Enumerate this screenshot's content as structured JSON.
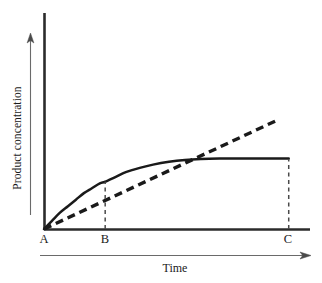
{
  "chart_data": {
    "type": "line",
    "title": "",
    "xlabel": "Time",
    "ylabel": "Product concentration",
    "grid": false,
    "legend": "none",
    "xlim": [
      0,
      100
    ],
    "ylim": [
      0,
      100
    ],
    "xtick_labels": [
      "A",
      "B",
      "C"
    ],
    "xtick_values": [
      0,
      23,
      92
    ],
    "ytick_labels": [],
    "annotations": [
      {
        "name": "dropline-b",
        "label": "B",
        "style": "dashed-vertical",
        "x": 23,
        "y_top": 29
      },
      {
        "name": "dropline-c",
        "label": "C",
        "style": "dashed-vertical",
        "x": 92,
        "y_top": 43
      }
    ],
    "series": [
      {
        "name": "product-formation-curve",
        "style": "solid",
        "color": "#1a1a1a",
        "points": [
          [
            0,
            0
          ],
          [
            3,
            5
          ],
          [
            6,
            10
          ],
          [
            9,
            14
          ],
          [
            12,
            18
          ],
          [
            15,
            22
          ],
          [
            18,
            25
          ],
          [
            21,
            28
          ],
          [
            23,
            29
          ],
          [
            27,
            32
          ],
          [
            31,
            35
          ],
          [
            36,
            37.5
          ],
          [
            41,
            39.5
          ],
          [
            47,
            41.2
          ],
          [
            53,
            42.3
          ],
          [
            59,
            42.9
          ],
          [
            66,
            43.2
          ],
          [
            74,
            43.3
          ],
          [
            83,
            43.3
          ],
          [
            92,
            43.2
          ]
        ]
      },
      {
        "name": "initial-rate-tangent",
        "style": "dashed",
        "color": "#1a1a1a",
        "points": [
          [
            0,
            0
          ],
          [
            88,
            67
          ]
        ]
      }
    ]
  },
  "labels": {
    "y_axis": "Product concentration",
    "x_axis": "Time",
    "point_a": "A",
    "point_b": "B",
    "point_c": "C"
  },
  "colors": {
    "axis": "#2b2b2b",
    "curve": "#1a1a1a",
    "tangent": "#1a1a1a",
    "dropline": "#4a4a4a",
    "arrow": "#5a5a5a",
    "background": "#ffffff"
  }
}
